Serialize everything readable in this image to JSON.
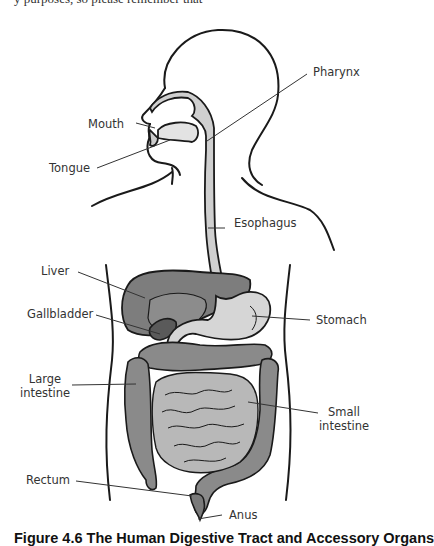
{
  "top_text": "y purposes, so please remember that",
  "figure": {
    "caption": "Figure 4.6 The Human Digestive Tract and Accessory Organs",
    "labels": {
      "pharynx": "Pharynx",
      "mouth": "Mouth",
      "tongue": "Tongue",
      "esophagus": "Esophagus",
      "liver": "Liver",
      "gallbladder": "Gallbladder",
      "stomach": "Stomach",
      "large_intestine_1": "Large",
      "large_intestine_2": "intestine",
      "small_intestine_1": "Small",
      "small_intestine_2": "intestine",
      "rectum": "Rectum",
      "anus": "Anus"
    },
    "colors": {
      "outline": "#1a1a1a",
      "tract_light": "#cfcfcf",
      "liver": "#7d7d7d",
      "gallbladder": "#5a5a5a",
      "stomach": "#d6d6d6",
      "large_intestine": "#8a8a8a",
      "small_intestine": "#b8b8b8"
    }
  }
}
